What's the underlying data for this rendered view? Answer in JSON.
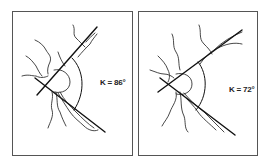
{
  "figure": {
    "panels": [
      {
        "id": "left",
        "angle_label": "K = 86°",
        "angle_degrees": 86
      },
      {
        "id": "right",
        "angle_label": "K = 72°",
        "angle_degrees": 72
      }
    ],
    "colors": {
      "line": "#111111",
      "vessel": "#333333",
      "border": "#555555",
      "background": "#ffffff"
    }
  }
}
